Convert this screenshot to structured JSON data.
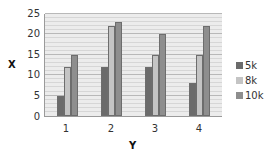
{
  "chart_data": {
    "type": "bar",
    "title": "",
    "xlabel": "Y",
    "ylabel": "X",
    "categories": [
      "1",
      "2",
      "3",
      "4"
    ],
    "series": [
      {
        "name": "5k",
        "values": [
          5,
          12,
          12,
          8
        ],
        "color": "#6b6b6b"
      },
      {
        "name": "8k",
        "values": [
          12,
          22,
          15,
          15
        ],
        "color": "#c4c4c4"
      },
      {
        "name": "10k",
        "values": [
          15,
          23,
          20,
          22
        ],
        "color": "#8e8e8e"
      }
    ],
    "ylim": [
      0,
      25
    ],
    "yticks": [
      "0",
      "5",
      "10",
      "15",
      "20",
      "25"
    ],
    "grid": true,
    "legend_position": "right"
  },
  "axis": {
    "x_title": "Y",
    "y_title": "X",
    "y_ticks": [
      "0",
      "5",
      "10",
      "15",
      "20",
      "25"
    ],
    "x_ticks": [
      "1",
      "2",
      "3",
      "4"
    ]
  },
  "legend": [
    {
      "label": "5k",
      "color": "#6b6b6b"
    },
    {
      "label": "8k",
      "color": "#c4c4c4"
    },
    {
      "label": "10k",
      "color": "#8e8e8e"
    }
  ]
}
